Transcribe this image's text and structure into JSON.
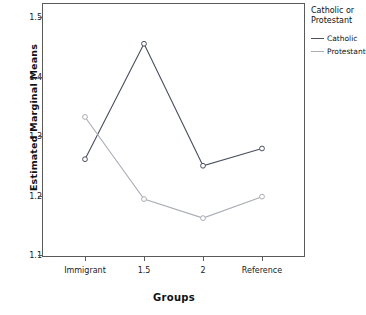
{
  "chart_data": {
    "type": "line",
    "title": "",
    "xlabel": "Groups",
    "ylabel": "Estimated Marginal Means",
    "categories": [
      "Immigrant",
      "1.5",
      "2",
      "Reference"
    ],
    "ylim": [
      1.1,
      1.5
    ],
    "yticks": [
      "1.1",
      "1.2",
      "1.3",
      "1.4",
      "1.5"
    ],
    "ytick_values": [
      1.1,
      1.2,
      1.3,
      1.4,
      1.5
    ],
    "grid": false,
    "legend_position": "right",
    "legend_title": "Catholic or Protestant",
    "marker": "open-circle",
    "series": [
      {
        "name": "Catholic",
        "color": "#4a5060",
        "values": [
          1.261,
          1.455,
          1.25,
          1.279
        ]
      },
      {
        "name": "Protestant",
        "color": "#a9adb4",
        "values": [
          1.332,
          1.194,
          1.162,
          1.198
        ]
      }
    ]
  },
  "legend": {
    "title_line1": "Catholic or",
    "title_line2": "Protestant",
    "entries": [
      {
        "label": "Catholic",
        "color": "#4a5060"
      },
      {
        "label": "Protestant",
        "color": "#a9adb4"
      }
    ]
  },
  "axes": {
    "y_title": "Estimated Marginal Means",
    "x_title": "Groups"
  }
}
